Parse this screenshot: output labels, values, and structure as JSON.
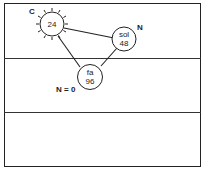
{
  "diagram": {
    "nodes": [
      {
        "id": "c-node",
        "name": "",
        "value": "24",
        "label": "C",
        "style": "sun"
      },
      {
        "id": "sol-node",
        "name": "sol",
        "value": "48",
        "label": "N"
      },
      {
        "id": "fa-node",
        "name": "fa",
        "value": "96",
        "label": "N = 0"
      }
    ],
    "edges": [
      {
        "from": "c-node",
        "to": "sol-node"
      },
      {
        "from": "c-node",
        "to": "fa-node"
      },
      {
        "from": "sol-node",
        "to": "fa-node"
      }
    ],
    "bands": 3
  }
}
